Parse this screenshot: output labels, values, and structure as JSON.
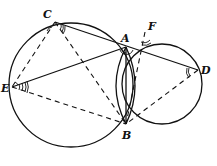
{
  "diagram": {
    "type": "geometry",
    "points": {
      "A": {
        "label": "A",
        "x": 126,
        "y": 47
      },
      "B": {
        "label": "B",
        "x": 126,
        "y": 124
      },
      "C": {
        "label": "C",
        "x": 55,
        "y": 22
      },
      "D": {
        "label": "D",
        "x": 198,
        "y": 70
      },
      "E": {
        "label": "E",
        "x": 12,
        "y": 87
      },
      "F": {
        "label": "F",
        "x": 145,
        "y": 32
      }
    },
    "circles": [
      {
        "name": "left-circle",
        "through": [
          "C",
          "A",
          "B",
          "E"
        ]
      },
      {
        "name": "right-circle",
        "through": [
          "A",
          "F",
          "D",
          "B"
        ]
      }
    ],
    "solid_segments": [
      [
        "C",
        "D"
      ],
      [
        "E",
        "A"
      ],
      [
        "A",
        "B"
      ]
    ],
    "dashed_segments": [
      [
        "C",
        "E"
      ],
      [
        "C",
        "B"
      ],
      [
        "E",
        "B"
      ],
      [
        "F",
        "B"
      ],
      [
        "D",
        "B"
      ]
    ],
    "marked_angles": [
      "ACB",
      "AEB",
      "AFB",
      "ADB",
      "CAB",
      "BAD"
    ]
  }
}
